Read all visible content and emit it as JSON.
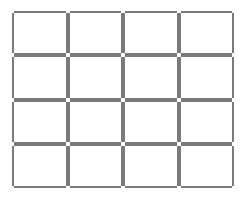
{
  "grid": {
    "rows": 4,
    "columns": 4,
    "border_color": "#7a7a7a",
    "background_color": "#ffffff",
    "cells": [
      [
        "",
        "",
        "",
        ""
      ],
      [
        "",
        "",
        "",
        ""
      ],
      [
        "",
        "",
        "",
        ""
      ],
      [
        "",
        "",
        "",
        ""
      ]
    ]
  }
}
